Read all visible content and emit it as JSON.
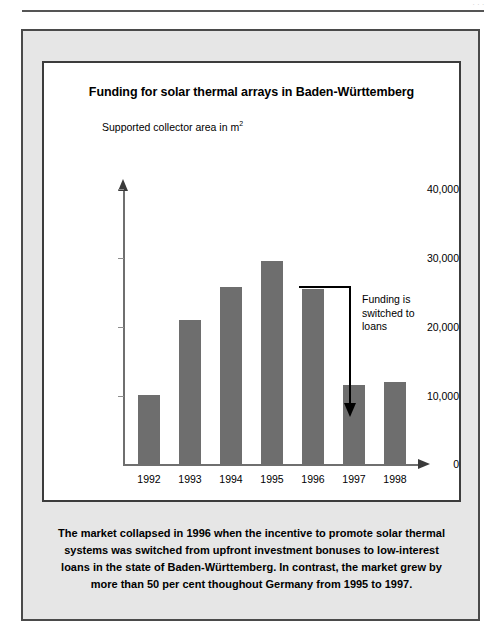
{
  "page": {
    "top_ghost_text": "..."
  },
  "figure": {
    "title": "Funding for solar thermal arrays in Baden-Württemberg",
    "y_axis_label": "Supported collector area in m",
    "y_axis_label_sup": "2",
    "annotation": "Funding is\nswitched to\nloans",
    "caption": "The market collapsed in 1996 when the incentive to promote solar thermal systems was switched from upfront investment bonuses to low-interest loans in the state of Baden-Württemberg. In contrast, the market grew by more than 50 per cent thoughout Germany from 1995 to 1997."
  },
  "colors": {
    "bar": "#6e6e6e",
    "panel_background": "#e6e6e6",
    "chart_background": "#ffffff",
    "border": "#3c3c3c",
    "axis": "#6f6f6f",
    "annotation": "#000000"
  },
  "chart_data": {
    "type": "bar",
    "title": "Funding for solar thermal arrays in Baden-Württemberg",
    "xlabel": "",
    "ylabel": "Supported collector area in m²",
    "categories": [
      "1992",
      "1993",
      "1994",
      "1995",
      "1996",
      "1997",
      "1998"
    ],
    "values": [
      10000,
      21000,
      25800,
      29600,
      25400,
      11500,
      12000
    ],
    "ylim": [
      0,
      40000
    ],
    "ytick_labels": [
      "0",
      "10,000",
      "20,000",
      "30,000",
      "40,000"
    ],
    "ytick_values": [
      0,
      10000,
      20000,
      30000,
      40000
    ],
    "grid": false,
    "legend": "none",
    "annotations": [
      {
        "text": "Funding is switched to loans",
        "points_to": "1997",
        "arrow": "elbow-down"
      }
    ]
  }
}
